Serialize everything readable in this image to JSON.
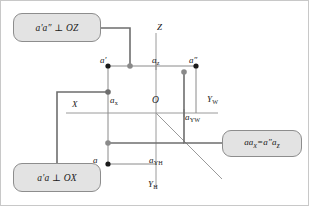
{
  "figure": {
    "background": "#ffffff",
    "frame_color": "#c8c8c8"
  },
  "colors": {
    "callout_fill": "#e3e3e3",
    "callout_border": "#8d8d8d",
    "axis_line": "#9a9a9a",
    "connector_line": "#6e6e6e",
    "point_black": "#1a1a1a",
    "point_gray": "#8a8a8a",
    "projection_line": "#8a8a8a",
    "text": "#202020"
  },
  "callouts": [
    {
      "id": "callout-az",
      "text": "a'a″ ⊥ OZ"
    },
    {
      "id": "callout-ax",
      "text": "a'a ⊥ OX"
    },
    {
      "id": "callout-eq",
      "text_main": "aa",
      "sub1": "x",
      "eq": "=a″a",
      "sub2": "z"
    }
  ],
  "axes": [
    {
      "name": "Z",
      "label": "Z",
      "sub": ""
    },
    {
      "name": "X",
      "label": "X",
      "sub": ""
    },
    {
      "name": "YW",
      "label": "Y",
      "sub": "W"
    },
    {
      "name": "YH",
      "label": "Y",
      "sub": "H"
    }
  ],
  "origin": {
    "label": "O"
  },
  "points": [
    {
      "name": "a-prime",
      "label": "a′",
      "sub": "",
      "x": 108,
      "y": 66,
      "style": "black"
    },
    {
      "name": "a-double-prime",
      "label": "a″",
      "sub": "",
      "x": 196,
      "y": 66,
      "style": "black"
    },
    {
      "name": "a-z",
      "label": "a",
      "sub": "z",
      "x": 156,
      "y": 66,
      "style": "tick"
    },
    {
      "name": "a-x",
      "label": "a",
      "sub": "x",
      "x": 108,
      "y": 113,
      "style": "tick"
    },
    {
      "name": "a-yw",
      "label": "a",
      "sub": "YW",
      "x": 184,
      "y": 113,
      "style": "tick"
    },
    {
      "name": "a-yh",
      "label": "a",
      "sub": "YH",
      "x": 156,
      "y": 164,
      "style": "tick"
    },
    {
      "name": "a",
      "label": "a",
      "sub": "",
      "x": 108,
      "y": 164,
      "style": "black"
    }
  ],
  "connector_nodes": [
    {
      "name": "node-top-az",
      "x": 130,
      "y": 66
    },
    {
      "name": "node-right-app",
      "x": 184,
      "y": 72
    },
    {
      "name": "node-left-ax",
      "x": 108,
      "y": 92
    },
    {
      "name": "node-bottom-eq",
      "x": 108,
      "y": 138
    }
  ],
  "annotations": {
    "bisector": "45-degree bisector from O",
    "line_style": "thin gray"
  }
}
